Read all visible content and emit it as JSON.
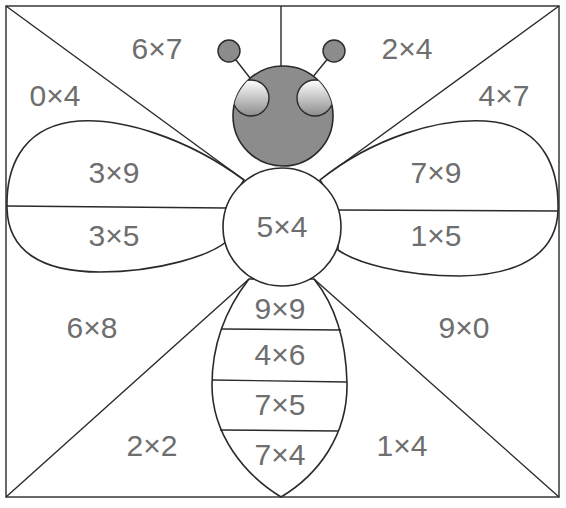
{
  "worksheet": {
    "title": "Bee multiplication coloring puzzle",
    "colors": {
      "head": "#8c8c8c",
      "antenna": "#8c8c8c",
      "outline": "#2a2a2a",
      "text": "#6e6e6e",
      "background": "#ffffff"
    },
    "regions": {
      "top_left": "6×7",
      "top_right": "2×4",
      "left_upper": "0×4",
      "right_upper": "4×7",
      "left_wing_upper": "3×9",
      "left_wing_lower": "3×5",
      "right_wing_upper": "7×9",
      "right_wing_lower": "1×5",
      "center": "5×4",
      "left_lower": "6×8",
      "right_lower": "9×0",
      "bottom_left": "2×2",
      "bottom_right": "1×4",
      "body_1": "9×9",
      "body_2": "4×6",
      "body_3": "7×5",
      "body_4": "7×4"
    }
  }
}
